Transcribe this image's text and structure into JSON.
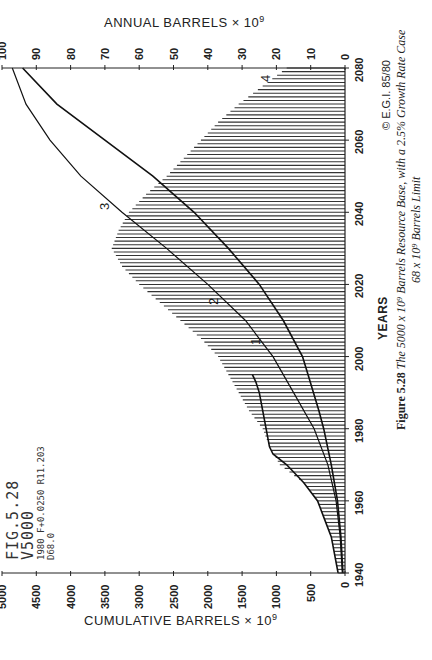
{
  "chart_data": {
    "type": "bar",
    "orientation": "rotated-90 (years vertical, values horizontal)",
    "xlabel": "YEARS",
    "ylabel_annual": "ANNUAL BARRELS × 10^9",
    "ylabel_cumulative": "CUMULATIVE BARRELS × 10^9",
    "year_ticks": [
      1940,
      1960,
      1980,
      2000,
      2020,
      2040,
      2060,
      2080
    ],
    "annual_ticks": [
      0,
      10,
      20,
      30,
      40,
      50,
      60,
      70,
      80,
      90,
      100
    ],
    "cumulative_ticks": [
      0,
      500,
      1000,
      1500,
      2000,
      2500,
      3000,
      3500,
      4000,
      4500,
      5000
    ],
    "annual_range": [
      0,
      100
    ],
    "cumulative_range": [
      0,
      5000
    ],
    "year_range": [
      1940,
      2080
    ],
    "grid": false,
    "series": [
      {
        "name": "Annual production (hatched bars)",
        "label": "4",
        "x": [
          1940,
          1945,
          1950,
          1955,
          1960,
          1965,
          1970,
          1975,
          1980,
          1985,
          1990,
          1995,
          2000,
          2005,
          2010,
          2015,
          2020,
          2025,
          2030,
          2035,
          2040,
          2045,
          2050,
          2055,
          2060,
          2065,
          2070,
          2075,
          2080
        ],
        "values": [
          2,
          3,
          4,
          6,
          8,
          12,
          19,
          22,
          24,
          28,
          31,
          34,
          37,
          42,
          48,
          54,
          60,
          65,
          68,
          66,
          63,
          58,
          52,
          47,
          42,
          37,
          31,
          24,
          17
        ]
      },
      {
        "name": "Curve 1 - annual production history (line)",
        "label": "1",
        "x": [
          1940,
          1950,
          1955,
          1960,
          1965,
          1970,
          1973,
          1975,
          1980,
          1985,
          1990,
          1993,
          1995
        ],
        "values": [
          2,
          4,
          6,
          8,
          12,
          17,
          21,
          22,
          23,
          24,
          25,
          26,
          27
        ]
      },
      {
        "name": "Curve 2 - cumulative production",
        "label": "2",
        "x": [
          1940,
          1950,
          1960,
          1970,
          1980,
          1990,
          2000,
          2010,
          2020,
          2030,
          2040,
          2050,
          2060,
          2070,
          2080
        ],
        "values": [
          40,
          70,
          130,
          250,
          450,
          750,
          1050,
          1450,
          2000,
          2600,
          3250,
          3850,
          4300,
          4650,
          4850
        ]
      },
      {
        "name": "Curve 3 - cumulative with growth case",
        "label": "3",
        "x": [
          1940,
          1950,
          1960,
          1970,
          1980,
          1985,
          1990,
          1995,
          2000,
          2010,
          2020,
          2030,
          2040,
          2050,
          2060,
          2070,
          2080
        ],
        "values": [
          30,
          60,
          110,
          200,
          310,
          380,
          460,
          540,
          620,
          900,
          1250,
          1700,
          2200,
          2800,
          3500,
          4200,
          4700
        ]
      }
    ],
    "annotations": [
      "1",
      "2",
      "3",
      "4"
    ]
  },
  "figure_block": {
    "line1": "FIG.5.28",
    "line2": "V5000",
    "line3": "1980 F+0.0250 R11.203",
    "line4": "D68.0"
  },
  "axes": {
    "top_title": "ANNUAL  BARRELS × 10",
    "top_title_sup": "9",
    "bottom_title": "CUMULATIVE  BARRELS × 10",
    "bottom_title_sup": "9",
    "year_title": "YEARS"
  },
  "caption": {
    "figure_label": "Figure 5.28",
    "text_line1": "The 5000 x 10⁹ Barrels Resource Base, with a 2.5% Growth Rate Case",
    "text_line2": "68 x 10⁹ Barrels Limit",
    "copyright": "© E.G.I. 85/80"
  }
}
